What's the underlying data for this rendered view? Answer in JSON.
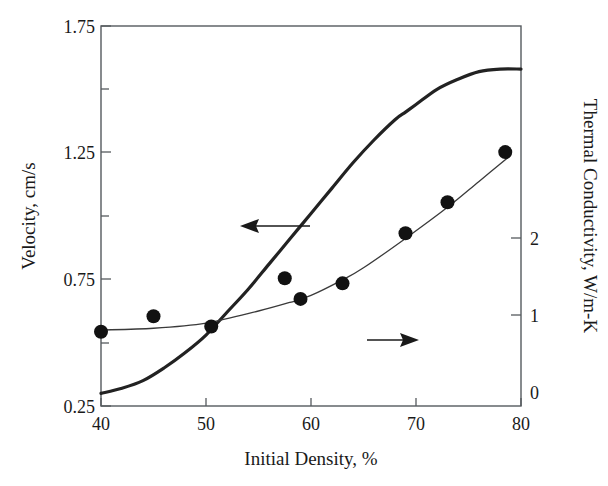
{
  "chart_data": {
    "type": "line",
    "title": "",
    "xlabel": "Initial Density, %",
    "ylabel": "Velocity, cm/s",
    "y2label": "Thermal Conductivity, W/m-K",
    "xlim": [
      40,
      80
    ],
    "ylim": [
      0.25,
      1.75
    ],
    "y2lim": [
      0,
      2.2
    ],
    "grid": false,
    "legend": "none",
    "xticks": [
      40,
      50,
      60,
      70,
      80
    ],
    "xtick_labels": [
      "40",
      "50",
      "60",
      "70",
      "80"
    ],
    "yticks": [
      0.25,
      0.75,
      1.25,
      1.75
    ],
    "ytick_labels": [
      "0.25",
      "0.75",
      "1.25",
      "1.75"
    ],
    "yticks_minor": [
      0.5,
      1.0,
      1.5
    ],
    "y2ticks": [
      0,
      1,
      2
    ],
    "y2tick_labels": [
      "0",
      "1",
      "2"
    ],
    "series": [
      {
        "name": "Velocity",
        "axis": "left",
        "style": "thick-line",
        "x": [
          40,
          42,
          44,
          46,
          48,
          50,
          52,
          54,
          56,
          58,
          60,
          62,
          64,
          66,
          68,
          69,
          70,
          72,
          74,
          76,
          78,
          80
        ],
        "values": [
          0.3,
          0.32,
          0.35,
          0.4,
          0.46,
          0.53,
          0.62,
          0.71,
          0.81,
          0.91,
          1.01,
          1.11,
          1.21,
          1.3,
          1.38,
          1.41,
          1.44,
          1.5,
          1.54,
          1.57,
          1.58,
          1.58
        ]
      },
      {
        "name": "Thermal Conductivity (fit)",
        "axis": "right",
        "style": "thin-line",
        "x": [
          40,
          45,
          50,
          55,
          58,
          60,
          63,
          65,
          69,
          73,
          76,
          79
        ],
        "values": [
          0.44,
          0.45,
          0.48,
          0.55,
          0.6,
          0.64,
          0.73,
          0.8,
          0.97,
          1.15,
          1.3,
          1.45
        ]
      },
      {
        "name": "Thermal Conductivity (measured)",
        "axis": "right",
        "style": "markers",
        "x": [
          40,
          45,
          50.5,
          57.5,
          59,
          63,
          69,
          73,
          78.5
        ],
        "values": [
          0.43,
          0.52,
          0.46,
          0.74,
          0.62,
          0.71,
          1.0,
          1.18,
          1.47
        ]
      }
    ],
    "annotations": [
      {
        "name": "left-arrow",
        "text": "",
        "points_to": "velocity-curve",
        "direction": "left"
      },
      {
        "name": "right-arrow",
        "text": "",
        "points_to": "thermal-conductivity-curve",
        "direction": "right"
      }
    ]
  }
}
